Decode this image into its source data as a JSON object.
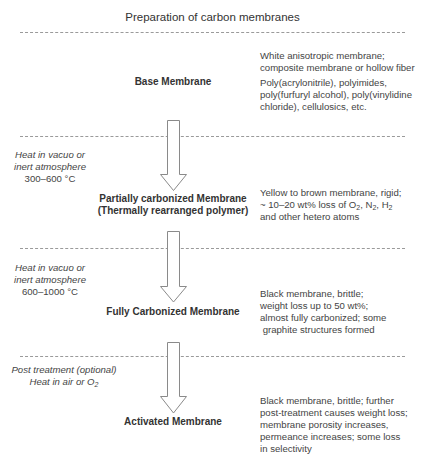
{
  "title": "Preparation of carbon membranes",
  "stages": [
    {
      "label_lines": [
        "Base Membrane"
      ],
      "notes": [
        [
          "White anisotropic membrane;",
          "composite membrane or hollow fiber"
        ],
        [
          "Poly(acrylonitrile), polyimides,",
          "poly(furfuryl alcohol), poly(vinylidine",
          "chloride), cellulosics, etc."
        ]
      ]
    },
    {
      "label_lines": [
        "Partially carbonized Membrane",
        "(Thermally rearranged polymer)"
      ],
      "condition": [
        "Heat in vacuo or",
        "inert atmosphere",
        "300–600 °C"
      ],
      "notes": [
        [
          "Yellow to brown membrane, rigid;",
          "~ 10–20 wt% loss of O2, N2, H2",
          "and other hetero atoms"
        ]
      ]
    },
    {
      "label_lines": [
        "Fully Carbonized Membrane"
      ],
      "condition": [
        "Heat in vacuo or",
        "inert atmosphere",
        "600–1000 °C"
      ],
      "notes": [
        [
          "Black membrane, brittle;",
          "weight loss up to 50 wt%;",
          "almost fully carbonized; some",
          " graphite structures formed"
        ]
      ]
    },
    {
      "label_lines": [
        "Activated Membrane"
      ],
      "condition": [
        "Post treatment (optional)",
        "Heat in air or O2"
      ],
      "notes": [
        [
          "Black membrane, brittle; further",
          "post-treatment causes weight loss;",
          "membrane porosity increases,",
          "permeance increases; some loss",
          "in selectivity"
        ]
      ]
    }
  ],
  "colors": {
    "text": "#333333",
    "dash": "#9a9a9a",
    "arrow_stroke": "#8a8a8a",
    "arrow_fill": "#ffffff"
  }
}
